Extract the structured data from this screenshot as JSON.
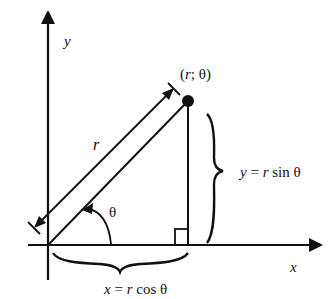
{
  "diagram": {
    "labels": {
      "y_axis": "y",
      "x_axis": "x",
      "point": "(r; θ)",
      "radius": "r",
      "angle": "θ",
      "vertical_eq": "y = r sin θ",
      "horizontal_eq": "x = r cos θ"
    },
    "colors": {
      "ink": "#111111",
      "background": "#ffffff"
    }
  }
}
